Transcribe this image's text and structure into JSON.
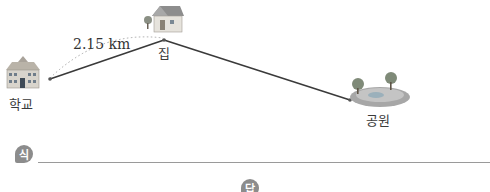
{
  "diagram": {
    "places": [
      {
        "id": "school",
        "label": "학교",
        "icon": "school-building-icon"
      },
      {
        "id": "house",
        "label": "집",
        "icon": "house-icon"
      },
      {
        "id": "park",
        "label": "공원",
        "icon": "park-icon"
      }
    ],
    "distance_school_house": "2.15 km"
  },
  "answer_area": {
    "formula_badge": "식",
    "answer_badge": "답"
  },
  "colors": {
    "route_line": "#3a3a3a",
    "dotted_arc": "#9a9a9a",
    "badge_bg": "#8c8c8c"
  }
}
